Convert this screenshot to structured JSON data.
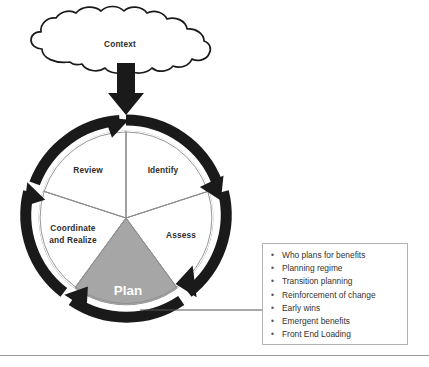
{
  "diagram": {
    "title_node": {
      "label": "Context",
      "shape": "cloud-shape"
    },
    "cycle": {
      "center_segment": {
        "label": "Plan",
        "fill": "#a6a6a6",
        "text_color": "#ffffff"
      },
      "segments": [
        {
          "label": "Identify"
        },
        {
          "label": "Assess"
        },
        {
          "label": "Plan"
        },
        {
          "label": "Coordinate and Realize"
        },
        {
          "label": "Review"
        }
      ],
      "segment_labels": {
        "identify": "Identify",
        "assess": "Assess",
        "plan": "Plan",
        "coordinate_line1": "Coordinate",
        "coordinate_line2": "and Realize",
        "review": "Review"
      },
      "arrow_color": "#1a1a1a"
    },
    "callout": {
      "items": [
        "Who plans for benefits",
        "Planning regime",
        "Transition planning",
        "Reinforcement of change",
        "Early wins",
        "Emergent benefits",
        "Front End Loading"
      ],
      "bullet_glyph": "•",
      "border_color": "#b3b3b3"
    }
  }
}
